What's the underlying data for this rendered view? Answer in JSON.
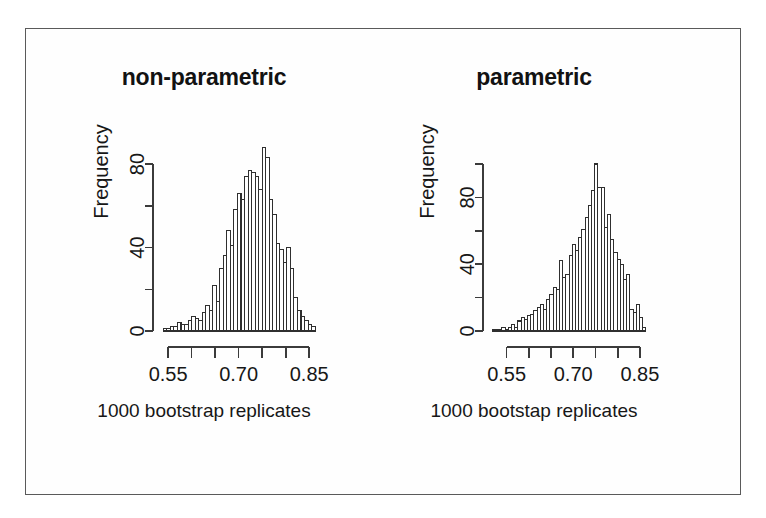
{
  "figure": {
    "frame_color": "#5a5a5a",
    "background": "#ffffff",
    "ink_color": "#2f2f2f"
  },
  "panels": [
    {
      "id": "non-parametric",
      "title": "non-parametric",
      "caption": "1000 bootstrap replicates",
      "ylabel": "Frequency"
    },
    {
      "id": "parametric",
      "title": "parametric",
      "caption": "1000 bootstap replicates",
      "ylabel": "Frequency"
    }
  ],
  "chart_data": [
    {
      "type": "bar",
      "id": "non-parametric",
      "title": "non-parametric",
      "xlabel": "1000 bootstrap replicates",
      "ylabel": "Frequency",
      "xlim": [
        0.535,
        0.875
      ],
      "ylim": [
        0,
        92
      ],
      "grid": false,
      "legend": null,
      "xticks": [
        0.55,
        0.6,
        0.65,
        0.7,
        0.75,
        0.8,
        0.85
      ],
      "xticklabels": [
        "0.55",
        "",
        "",
        "0.70",
        "",
        "",
        "0.85"
      ],
      "yticks": [
        0,
        20,
        40,
        60,
        80
      ],
      "yticklabels": [
        "0",
        "",
        "40",
        "",
        "80"
      ],
      "bin_width": 0.0075,
      "bin_starts": [
        0.54,
        0.5475,
        0.555,
        0.5625,
        0.57,
        0.5775,
        0.585,
        0.5925,
        0.6,
        0.6075,
        0.615,
        0.6225,
        0.63,
        0.6375,
        0.645,
        0.6525,
        0.66,
        0.6675,
        0.675,
        0.6825,
        0.69,
        0.6975,
        0.705,
        0.7125,
        0.72,
        0.7275,
        0.735,
        0.7425,
        0.75,
        0.7575,
        0.765,
        0.7725,
        0.78,
        0.7875,
        0.795,
        0.8025,
        0.81,
        0.8175,
        0.825,
        0.8325,
        0.84,
        0.8475,
        0.855
      ],
      "values": [
        1,
        1,
        2,
        2,
        4,
        3,
        3,
        5,
        7,
        6,
        5,
        9,
        12,
        10,
        22,
        14,
        30,
        36,
        48,
        41,
        58,
        66,
        63,
        74,
        77,
        76,
        74,
        68,
        88,
        83,
        63,
        56,
        42,
        39,
        33,
        40,
        30,
        16,
        10,
        7,
        5,
        3,
        2
      ]
    },
    {
      "type": "bar",
      "id": "parametric",
      "title": "parametric",
      "xlabel": "1000 bootstap replicates",
      "ylabel": "Frequency",
      "xlim": [
        0.515,
        0.875
      ],
      "ylim": [
        0,
        103
      ],
      "grid": false,
      "legend": null,
      "xticks": [
        0.55,
        0.6,
        0.65,
        0.7,
        0.75,
        0.8,
        0.85
      ],
      "xticklabels": [
        "0.55",
        "",
        "",
        "0.70",
        "",
        "",
        "0.85"
      ],
      "yticks": [
        0,
        20,
        40,
        60,
        80,
        100
      ],
      "yticklabels": [
        "0",
        "",
        "40",
        "",
        "80",
        ""
      ],
      "bin_width": 0.0072,
      "bin_starts": [
        0.518,
        0.5252,
        0.5324,
        0.5396,
        0.5468,
        0.554,
        0.5612,
        0.5684,
        0.5756,
        0.5828,
        0.59,
        0.5972,
        0.6044,
        0.6116,
        0.6188,
        0.626,
        0.6332,
        0.6404,
        0.6476,
        0.6548,
        0.662,
        0.6692,
        0.6764,
        0.6836,
        0.6908,
        0.698,
        0.7052,
        0.7124,
        0.7196,
        0.7268,
        0.734,
        0.7412,
        0.7484,
        0.7556,
        0.7628,
        0.77,
        0.7772,
        0.7844,
        0.7916,
        0.7988,
        0.806,
        0.8132,
        0.8204,
        0.8276,
        0.8348,
        0.842,
        0.8492,
        0.8564
      ],
      "values": [
        1,
        1,
        1,
        2,
        1,
        2,
        4,
        2,
        6,
        8,
        7,
        9,
        10,
        12,
        14,
        16,
        13,
        19,
        22,
        26,
        25,
        42,
        32,
        34,
        45,
        52,
        48,
        56,
        61,
        68,
        75,
        84,
        100,
        86,
        86,
        62,
        70,
        55,
        47,
        43,
        40,
        31,
        34,
        13,
        11,
        16,
        8,
        2
      ]
    }
  ]
}
